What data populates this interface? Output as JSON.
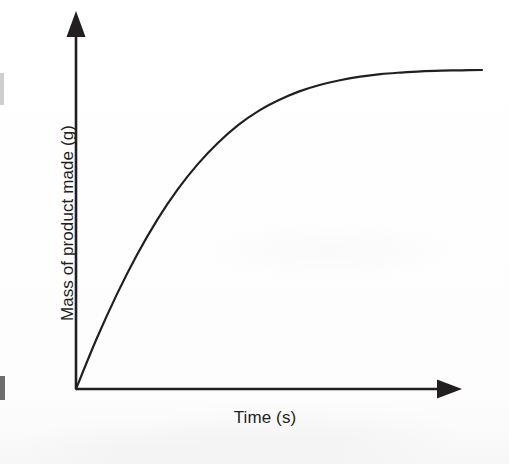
{
  "figure": {
    "background_color": "#fdfdfd",
    "ink_color": "#231f20",
    "y_axis_label": "Mass of product made (g)",
    "x_axis_label": "Time (s)",
    "y_axis_arrow": "up-arrow-icon",
    "x_axis_arrow": "right-arrow-icon"
  },
  "chart_data": {
    "type": "line",
    "title": "",
    "subtitle": "",
    "xlabel": "Time (s)",
    "ylabel": "Mass of product made (g)",
    "grid": false,
    "legend": null,
    "legend_position": "none",
    "axis_style": "arrow-headed axes, no tick marks, no numeric tick labels",
    "xlim": [
      0,
      1
    ],
    "ylim": [
      0,
      1
    ],
    "xticks": [],
    "yticks": [],
    "xticklabels": [],
    "yticklabels": [],
    "annotations": [],
    "series": [
      {
        "name": "mass of product made",
        "line_color": "#231f20",
        "line_width": 2.2,
        "x": [
          0.0,
          0.05,
          0.1,
          0.15,
          0.2,
          0.25,
          0.3,
          0.35,
          0.4,
          0.45,
          0.5,
          0.55,
          0.6,
          0.65,
          0.7,
          0.75,
          0.8,
          0.85,
          0.9,
          0.95,
          1.0
        ],
        "y": [
          0.0,
          0.155,
          0.295,
          0.42,
          0.53,
          0.625,
          0.705,
          0.772,
          0.828,
          0.872,
          0.906,
          0.933,
          0.953,
          0.968,
          0.979,
          0.987,
          0.992,
          0.996,
          0.998,
          0.999,
          1.0
        ]
      }
    ]
  }
}
